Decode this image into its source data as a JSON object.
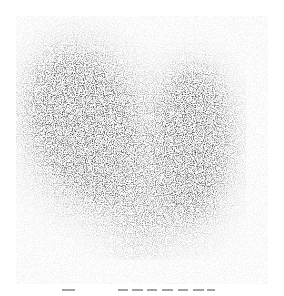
{
  "image": {
    "subject": "scintigraphy-scan",
    "description": "Grayscale nuclear medicine scan showing two dark, grainy lobes on white background",
    "lobes": [
      {
        "name": "left-lobe",
        "cx": 85,
        "cy": 125,
        "rx": 55,
        "ry": 80,
        "rotate": -20
      },
      {
        "name": "right-lobe",
        "cx": 190,
        "cy": 145,
        "rx": 40,
        "ry": 80,
        "rotate": 5
      }
    ],
    "colors": {
      "background": "#ffffff",
      "uptake_dark": "#1e1e1e",
      "noise": "#6a6a6a"
    }
  },
  "caption": {
    "visible": "partial",
    "text": ""
  }
}
